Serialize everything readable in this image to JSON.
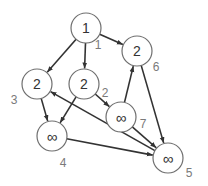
{
  "diagram": {
    "type": "directed-graph",
    "colors": {
      "edge": "#333333",
      "node_stroke": "#6f6f6f",
      "node_fill": "#ffffff",
      "value_text": "#333333",
      "id_text": "#7a7a7a"
    },
    "node_radius": 15,
    "nodes": [
      {
        "id": "1",
        "value": "1",
        "cx": 86,
        "cy": 28,
        "label_x": 98,
        "label_y": 45
      },
      {
        "id": "2",
        "value": "2",
        "cx": 84,
        "cy": 84,
        "label_x": 105,
        "label_y": 93
      },
      {
        "id": "3",
        "value": "2",
        "cx": 37,
        "cy": 84,
        "label_x": 14,
        "label_y": 100
      },
      {
        "id": "4",
        "value": "∞",
        "cx": 52,
        "cy": 136,
        "label_x": 63,
        "label_y": 163
      },
      {
        "id": "5",
        "value": "∞",
        "cx": 168,
        "cy": 158,
        "label_x": 189,
        "label_y": 173
      },
      {
        "id": "6",
        "value": "2",
        "cx": 137,
        "cy": 51,
        "label_x": 156,
        "label_y": 67
      },
      {
        "id": "7",
        "value": "∞",
        "cx": 121,
        "cy": 117,
        "label_x": 143,
        "label_y": 124
      }
    ],
    "edges": [
      {
        "from": "1",
        "to": "3"
      },
      {
        "from": "1",
        "to": "2"
      },
      {
        "from": "1",
        "to": "6"
      },
      {
        "from": "3",
        "to": "4"
      },
      {
        "from": "2",
        "to": "4"
      },
      {
        "from": "2",
        "to": "7"
      },
      {
        "from": "7",
        "to": "6"
      },
      {
        "from": "7",
        "to": "5"
      },
      {
        "from": "6",
        "to": "5"
      },
      {
        "from": "4",
        "to": "5"
      },
      {
        "from": "5",
        "to": "3"
      }
    ]
  }
}
